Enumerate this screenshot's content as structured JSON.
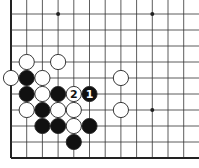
{
  "diagram": {
    "grid": {
      "origin_x": 11,
      "origin_y": 14,
      "spacing_x": 15.7,
      "spacing_y": 16,
      "cols": 12,
      "rows": 10,
      "edges": [
        "left",
        "bottom"
      ]
    },
    "star_points": [
      {
        "col": 3,
        "row": 0
      },
      {
        "col": 9,
        "row": 0
      },
      {
        "col": 9,
        "row": 6
      }
    ],
    "stones": [
      {
        "color": "white",
        "col": 1,
        "row": 3
      },
      {
        "color": "white",
        "col": 3,
        "row": 3
      },
      {
        "color": "white",
        "col": 0,
        "row": 4
      },
      {
        "color": "black",
        "col": 1,
        "row": 4
      },
      {
        "color": "white",
        "col": 2,
        "row": 4
      },
      {
        "color": "white",
        "col": 7,
        "row": 4
      },
      {
        "color": "black",
        "col": 1,
        "row": 5
      },
      {
        "color": "white",
        "col": 2,
        "row": 5
      },
      {
        "color": "black",
        "col": 3,
        "row": 5
      },
      {
        "color": "white",
        "col": 4,
        "row": 5,
        "label": "2"
      },
      {
        "color": "black",
        "col": 5,
        "row": 5,
        "label": "1"
      },
      {
        "color": "white",
        "col": 1,
        "row": 6
      },
      {
        "color": "black",
        "col": 2,
        "row": 6
      },
      {
        "color": "white",
        "col": 3,
        "row": 6
      },
      {
        "color": "white",
        "col": 4,
        "row": 6
      },
      {
        "color": "white",
        "col": 7,
        "row": 6
      },
      {
        "color": "black",
        "col": 2,
        "row": 7
      },
      {
        "color": "black",
        "col": 3,
        "row": 7
      },
      {
        "color": "white",
        "col": 4,
        "row": 7
      },
      {
        "color": "black",
        "col": 5,
        "row": 7
      },
      {
        "color": "black",
        "col": 4,
        "row": 8
      }
    ],
    "colors": {
      "line": "#333333",
      "edge": "#222222",
      "black_stone": "#111111",
      "white_stone": "#ffffff",
      "stone_outline": "#222222"
    }
  }
}
